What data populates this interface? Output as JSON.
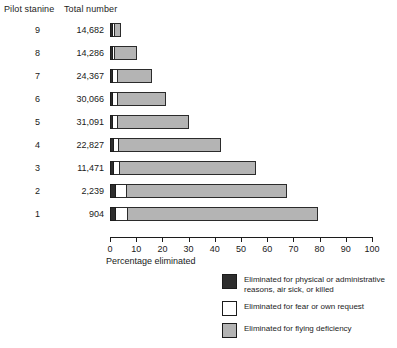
{
  "headers": {
    "stanine": "Pilot stanine",
    "total": "Total number"
  },
  "axis": {
    "xlabel": "Percentage eliminated",
    "ticks": [
      "0",
      "10",
      "20",
      "30",
      "40",
      "50",
      "60",
      "70",
      "80",
      "90",
      "100"
    ]
  },
  "legend": {
    "items": [
      {
        "key": "physical",
        "label": "Eliminated for physical or administrative reasons, air sick, or killed",
        "color": "#2e2e2e"
      },
      {
        "key": "fear",
        "label": "Eliminated for fear or own request",
        "color": "#ffffff"
      },
      {
        "key": "flying",
        "label": "Eliminated for flying deficiency",
        "color": "#b4b4b4"
      }
    ]
  },
  "chart_data": {
    "type": "bar",
    "orientation": "horizontal",
    "stacked": true,
    "title": "",
    "xlabel": "Percentage eliminated",
    "ylabel": "Pilot stanine",
    "xlim": [
      0,
      100
    ],
    "grid": false,
    "legend_position": "bottom-right",
    "categories": [
      "9",
      "8",
      "7",
      "6",
      "5",
      "4",
      "3",
      "2",
      "1"
    ],
    "totals": [
      "14,682",
      "14,286",
      "24,367",
      "30,066",
      "31,091",
      "22,827",
      "11,471",
      "2,239",
      "904"
    ],
    "series": [
      {
        "name": "Eliminated for physical or administrative reasons, air sick, or killed",
        "color": "#2e2e2e",
        "values": [
          1.1,
          1.1,
          1.2,
          1.2,
          1.2,
          1.4,
          1.5,
          2.3,
          2.4
        ]
      },
      {
        "name": "Eliminated for fear or own request",
        "color": "#ffffff",
        "values": [
          0.7,
          0.8,
          1.8,
          1.8,
          1.8,
          2.0,
          2.3,
          4.2,
          4.3
        ]
      },
      {
        "name": "Eliminated for flying deficiency",
        "color": "#b4b4b4",
        "values": [
          2.4,
          8.3,
          13.2,
          18.2,
          27.2,
          38.8,
          52.0,
          61.2,
          72.8
        ]
      }
    ],
    "rows": [
      {
        "stanine": "9",
        "total": "14,682",
        "physical": 1.1,
        "fear": 0.7,
        "flying": 2.4,
        "sum": 4.2
      },
      {
        "stanine": "8",
        "total": "14,286",
        "physical": 1.1,
        "fear": 0.8,
        "flying": 8.3,
        "sum": 10.2
      },
      {
        "stanine": "7",
        "total": "24,367",
        "physical": 1.2,
        "fear": 1.8,
        "flying": 13.2,
        "sum": 16.2
      },
      {
        "stanine": "6",
        "total": "30,066",
        "physical": 1.2,
        "fear": 1.8,
        "flying": 18.2,
        "sum": 21.2
      },
      {
        "stanine": "5",
        "total": "31,091",
        "physical": 1.2,
        "fear": 1.8,
        "flying": 27.2,
        "sum": 30.2
      },
      {
        "stanine": "4",
        "total": "22,827",
        "physical": 1.4,
        "fear": 2.0,
        "flying": 38.8,
        "sum": 42.2
      },
      {
        "stanine": "3",
        "total": "11,471",
        "physical": 1.5,
        "fear": 2.3,
        "flying": 52.0,
        "sum": 55.8
      },
      {
        "stanine": "2",
        "total": "2,239",
        "physical": 2.3,
        "fear": 4.2,
        "flying": 61.2,
        "sum": 67.7
      },
      {
        "stanine": "1",
        "total": "904",
        "physical": 2.4,
        "fear": 4.3,
        "flying": 72.8,
        "sum": 79.5
      }
    ]
  }
}
